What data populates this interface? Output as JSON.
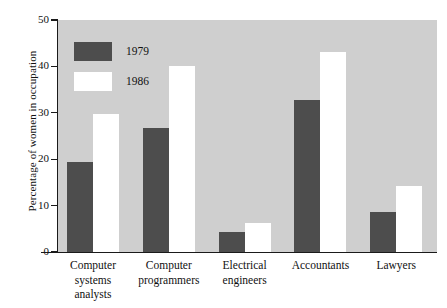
{
  "chart_data": {
    "type": "bar",
    "title": "",
    "xlabel": "",
    "ylabel": "Percentage of women in occupation",
    "ylim": [
      0,
      50
    ],
    "yticks": [
      0,
      10,
      20,
      30,
      40,
      50
    ],
    "ytick_labels": [
      "0",
      "10",
      "20",
      "30",
      "40",
      "50"
    ],
    "grid": false,
    "legend_position": "top-left",
    "categories": [
      "Computer systems analysts",
      "Computer programmers",
      "Electrical engineers",
      "Accountants",
      "Lawyers"
    ],
    "category_lines": [
      [
        "Computer",
        "systems",
        "analysts"
      ],
      [
        "Computer",
        "programmers"
      ],
      [
        "Electrical",
        "engineers"
      ],
      [
        "Accountants"
      ],
      [
        "Lawyers"
      ]
    ],
    "series": [
      {
        "name": "1979",
        "color": "#4d4d4d",
        "values": [
          19.5,
          26.7,
          4.3,
          32.8,
          8.6
        ]
      },
      {
        "name": "1986",
        "color": "#ffffff",
        "values": [
          29.7,
          40.0,
          6.3,
          43.0,
          14.2
        ]
      }
    ],
    "plot_background": "#cfcfcf",
    "axis_color": "#1a1a1a"
  },
  "legend": {
    "items": [
      {
        "label": "1979",
        "swatch": "dark-gray"
      },
      {
        "label": "1986",
        "swatch": "white"
      }
    ]
  },
  "axis": {
    "y_title": "Percentage of women in occupation",
    "y_ticks": [
      "50",
      "40",
      "30",
      "20",
      "10",
      "0"
    ]
  }
}
